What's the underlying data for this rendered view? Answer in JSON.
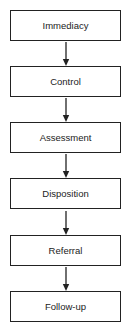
{
  "diagram": {
    "type": "vertical-flowchart",
    "colors": {
      "stroke": "#222222",
      "text": "#222222",
      "background": "#ffffff"
    },
    "steps": [
      {
        "label": "Immediacy"
      },
      {
        "label": "Control"
      },
      {
        "label": "Assessment"
      },
      {
        "label": "Disposition"
      },
      {
        "label": "Referral"
      },
      {
        "label": "Follow-up"
      }
    ],
    "edges": [
      {
        "from": "Immediacy",
        "to": "Control"
      },
      {
        "from": "Control",
        "to": "Assessment"
      },
      {
        "from": "Assessment",
        "to": "Disposition"
      },
      {
        "from": "Disposition",
        "to": "Referral"
      },
      {
        "from": "Referral",
        "to": "Follow-up"
      }
    ]
  }
}
